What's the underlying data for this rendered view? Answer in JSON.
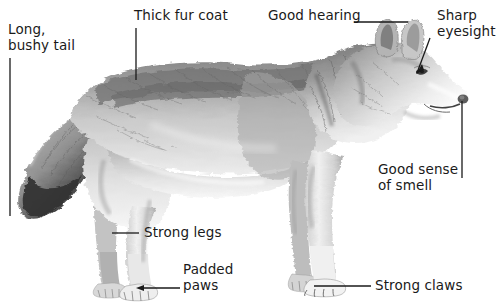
{
  "figure": {
    "subject_description": "Pencil-style grayscale drawing of a grey wolf standing in profile facing right",
    "background_color": "#ffffff",
    "text_color": "#1a1a1a",
    "leader_line_color": "#1a1a1a",
    "width": 504,
    "height": 305
  },
  "annotations": [
    {
      "id": "long-bushy-tail",
      "text_line1": "Long,",
      "text_line2": "bushy tail",
      "text_x": 8,
      "text_y": 22,
      "line": {
        "type": "vertical",
        "x": 10,
        "y1": 58,
        "y2": 216
      }
    },
    {
      "id": "thick-fur-coat",
      "text_line1": "Thick fur coat",
      "text_line2": "",
      "text_x": 134,
      "text_y": 8,
      "line": {
        "type": "vertical",
        "x": 136,
        "y1": 28,
        "y2": 80
      }
    },
    {
      "id": "good-hearing",
      "text_line1": "Good hearing",
      "text_line2": "",
      "text_x": 268,
      "text_y": 8,
      "line": {
        "type": "horizontal",
        "y": 22,
        "x1": 354,
        "x2": 408
      }
    },
    {
      "id": "sharp-eyesight",
      "text_line1": "Sharp",
      "text_line2": "eyesight",
      "text_x": 437,
      "text_y": 8,
      "line": {
        "type": "diagonal-arrow",
        "x1": 430,
        "y1": 38,
        "x2": 417,
        "y2": 73
      }
    },
    {
      "id": "good-sense-of-smell",
      "text_line1": "Good sense",
      "text_line2": "of smell",
      "text_x": 378,
      "text_y": 162,
      "line": {
        "type": "vertical",
        "x": 462,
        "y1": 101,
        "y2": 178
      }
    },
    {
      "id": "strong-legs",
      "text_line1": "Strong legs",
      "text_line2": "",
      "text_x": 144,
      "text_y": 225,
      "line": {
        "type": "horizontal",
        "y": 233,
        "x1": 112,
        "x2": 139
      }
    },
    {
      "id": "padded-paws",
      "text_line1": "Padded",
      "text_line2": "paws",
      "text_x": 183,
      "text_y": 262,
      "line": {
        "type": "horizontal-arrow-left",
        "y": 288,
        "x1": 137,
        "x2": 180
      }
    },
    {
      "id": "strong-claws",
      "text_line1": "Strong claws",
      "text_line2": "",
      "text_x": 375,
      "text_y": 278,
      "line": {
        "type": "horizontal",
        "y": 286,
        "x1": 314,
        "x2": 371
      }
    }
  ]
}
